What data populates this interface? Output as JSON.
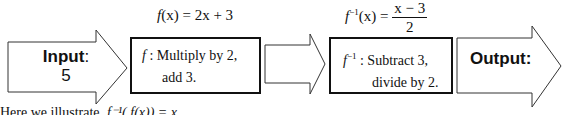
{
  "diagram": {
    "input_arrow": {
      "label": "Input",
      "colon": ":",
      "value": "5"
    },
    "function_box": {
      "symbol": "f",
      "separator": ":",
      "line1": "Multiply by 2,",
      "line2": "add 3."
    },
    "function_formula": {
      "lhs_fn": "f",
      "lhs_arg": "(x)",
      "eq": "=",
      "rhs": "2x + 3"
    },
    "connector_arrow": {
      "label": ""
    },
    "inverse_box": {
      "symbol": "f",
      "superscript": "−1",
      "separator": ":",
      "line1": "Subtract 3,",
      "line2": "divide by 2."
    },
    "inverse_formula": {
      "lhs_fn": "f",
      "lhs_sup": "−1",
      "lhs_arg": "(x)",
      "eq": "=",
      "numerator": "x − 3",
      "denominator": "2"
    },
    "output_arrow": {
      "label": "Output:"
    },
    "caption": {
      "text": "Here we illustrate",
      "math": "f⁻¹( f(x)) = x"
    },
    "colors": {
      "stroke": "#111111",
      "fill": "#ffffff",
      "text": "#111111"
    }
  }
}
